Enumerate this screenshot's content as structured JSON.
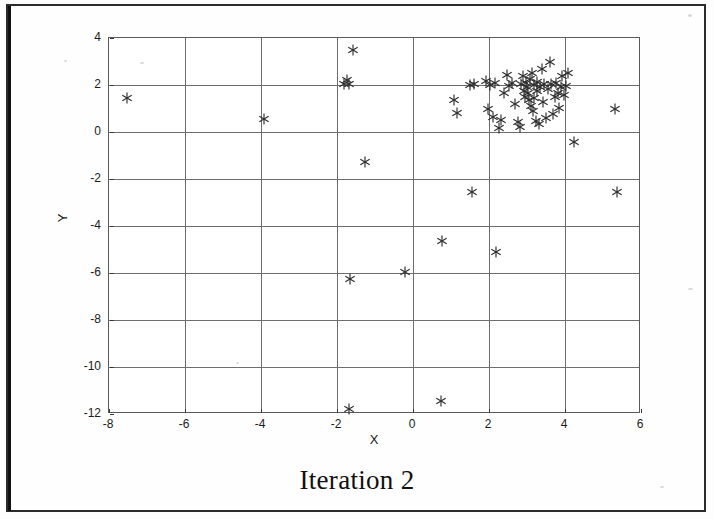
{
  "figure": {
    "caption": "Iteration 2",
    "xlabel": "X",
    "ylabel": "Y"
  },
  "chart_data": {
    "type": "scatter",
    "title": "Iteration 2",
    "xlabel": "X",
    "ylabel": "Y",
    "xlim": [
      -8,
      6
    ],
    "ylim": [
      -12,
      4
    ],
    "xticks": [
      -8,
      -6,
      -4,
      -2,
      0,
      2,
      4,
      6
    ],
    "yticks": [
      -12,
      -10,
      -8,
      -6,
      -4,
      -2,
      0,
      2,
      4
    ],
    "xtick_labels": [
      "-8",
      "-6",
      "-4",
      "-2",
      "0",
      "2",
      "4",
      "6"
    ],
    "ytick_labels": [
      "-12",
      "-10",
      "-8",
      "-6",
      "-4",
      "-2",
      "0",
      "2",
      "4"
    ],
    "grid": true,
    "legend": null,
    "marker": "asterisk",
    "marker_color": "#2e2e2e",
    "series": [
      {
        "name": "data",
        "points": [
          [
            -7.5,
            1.4
          ],
          [
            -3.9,
            0.5
          ],
          [
            -1.55,
            3.45
          ],
          [
            -1.72,
            2.15
          ],
          [
            -1.66,
            2.02
          ],
          [
            -1.8,
            1.98
          ],
          [
            -1.25,
            -1.3
          ],
          [
            -1.62,
            -6.3
          ],
          [
            -1.65,
            -11.85
          ],
          [
            -0.18,
            -6.0
          ],
          [
            0.75,
            -11.5
          ],
          [
            0.8,
            -4.7
          ],
          [
            1.1,
            1.3
          ],
          [
            1.18,
            0.75
          ],
          [
            1.52,
            1.95
          ],
          [
            1.62,
            2.0
          ],
          [
            1.58,
            -2.6
          ],
          [
            1.95,
            2.12
          ],
          [
            2.05,
            1.95
          ],
          [
            2.18,
            2.05
          ],
          [
            2.0,
            0.95
          ],
          [
            2.12,
            0.6
          ],
          [
            2.28,
            0.12
          ],
          [
            2.35,
            0.45
          ],
          [
            2.42,
            1.62
          ],
          [
            2.5,
            2.4
          ],
          [
            2.55,
            1.9
          ],
          [
            2.62,
            2.05
          ],
          [
            2.7,
            1.15
          ],
          [
            2.78,
            0.38
          ],
          [
            2.85,
            0.15
          ],
          [
            2.88,
            1.98
          ],
          [
            2.92,
            2.35
          ],
          [
            2.95,
            1.72
          ],
          [
            2.98,
            1.45
          ],
          [
            3.0,
            2.05
          ],
          [
            3.02,
            1.88
          ],
          [
            3.05,
            1.6
          ],
          [
            3.08,
            1.3
          ],
          [
            3.1,
            2.2
          ],
          [
            3.12,
            1.05
          ],
          [
            3.15,
            2.48
          ],
          [
            3.18,
            0.85
          ],
          [
            3.2,
            1.95
          ],
          [
            3.22,
            1.42
          ],
          [
            3.25,
            0.42
          ],
          [
            3.28,
            2.1
          ],
          [
            3.3,
            1.72
          ],
          [
            3.35,
            0.3
          ],
          [
            3.38,
            1.88
          ],
          [
            3.42,
            2.62
          ],
          [
            3.45,
            1.25
          ],
          [
            3.48,
            2.02
          ],
          [
            3.52,
            0.55
          ],
          [
            3.58,
            1.8
          ],
          [
            3.62,
            2.92
          ],
          [
            3.65,
            1.98
          ],
          [
            3.7,
            0.72
          ],
          [
            3.75,
            1.45
          ],
          [
            3.8,
            2.05
          ],
          [
            3.85,
            1.62
          ],
          [
            3.88,
            0.98
          ],
          [
            3.92,
            1.88
          ],
          [
            3.95,
            2.35
          ],
          [
            4.0,
            1.52
          ],
          [
            4.05,
            1.92
          ],
          [
            4.1,
            2.45
          ],
          [
            2.2,
            -5.15
          ],
          [
            4.25,
            -0.45
          ],
          [
            5.35,
            0.95
          ],
          [
            5.4,
            -2.6
          ]
        ]
      }
    ]
  }
}
